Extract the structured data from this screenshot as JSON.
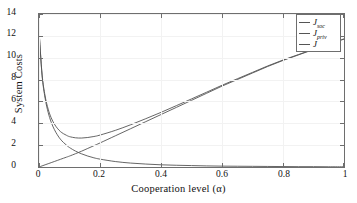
{
  "chart_data": {
    "type": "line",
    "title": "",
    "xlabel": "Cooperation level (α)",
    "ylabel": "System Costs",
    "xlim": [
      0,
      1
    ],
    "ylim": [
      0,
      14
    ],
    "xticks": [
      "0",
      "0.2",
      "0.4",
      "0.6",
      "0.8",
      "1"
    ],
    "xtick_values": [
      0,
      0.2,
      0.4,
      0.6,
      0.8,
      1
    ],
    "yticks": [
      "0",
      "2",
      "4",
      "6",
      "8",
      "10",
      "12",
      "14"
    ],
    "ytick_values": [
      0,
      2,
      4,
      6,
      8,
      10,
      12,
      14
    ],
    "grid": true,
    "legend_position": "top-right",
    "legend": [
      {
        "label_base": "J",
        "label_sub": "soc",
        "color": "#555555"
      },
      {
        "label_base": "J",
        "label_sub": "priv",
        "color": "#555555"
      },
      {
        "label_base": "J",
        "label_sub": "",
        "color": "#555555"
      }
    ],
    "x": [
      0,
      0.01,
      0.02,
      0.03,
      0.04,
      0.05,
      0.06,
      0.07,
      0.08,
      0.09,
      0.1,
      0.12,
      0.14,
      0.16,
      0.18,
      0.2,
      0.25,
      0.3,
      0.35,
      0.4,
      0.45,
      0.5,
      0.55,
      0.6,
      0.65,
      0.7,
      0.75,
      0.8,
      0.85,
      0.9,
      0.95,
      1
    ],
    "series": [
      {
        "name": "J_soc",
        "label": "J_{soc}",
        "color": "#555555",
        "values": [
          0,
          0.1,
          0.2,
          0.3,
          0.4,
          0.5,
          0.6,
          0.7,
          0.8,
          0.9,
          1.0,
          1.22,
          1.45,
          1.7,
          1.95,
          2.2,
          2.85,
          3.5,
          4.15,
          4.8,
          5.45,
          6.1,
          6.75,
          7.4,
          8.0,
          8.6,
          9.2,
          9.75,
          10.25,
          10.75,
          11.25,
          11.7
        ]
      },
      {
        "name": "J_priv",
        "label": "J_{priv}",
        "color": "#555555",
        "values": [
          12.5,
          8.4,
          6.3,
          5.0,
          4.1,
          3.45,
          2.95,
          2.55,
          2.25,
          2.0,
          1.78,
          1.45,
          1.2,
          1.0,
          0.84,
          0.72,
          0.5,
          0.36,
          0.27,
          0.2,
          0.16,
          0.13,
          0.1,
          0.08,
          0.07,
          0.06,
          0.05,
          0.04,
          0.03,
          0.03,
          0.02,
          0.02
        ]
      },
      {
        "name": "J",
        "label": "J",
        "color": "#555555",
        "values": [
          12.5,
          8.5,
          6.5,
          5.3,
          4.5,
          3.95,
          3.55,
          3.25,
          3.05,
          2.9,
          2.78,
          2.67,
          2.65,
          2.7,
          2.79,
          2.92,
          3.35,
          3.86,
          4.42,
          5.0,
          5.61,
          6.23,
          6.85,
          7.48,
          8.07,
          8.66,
          9.25,
          9.79,
          10.28,
          10.78,
          11.27,
          11.72
        ]
      }
    ],
    "annotations": {
      "min_of_total": {
        "x": 0.14,
        "y": 2.65
      },
      "crossover_soc_priv": {
        "x": 0.135,
        "y": 1.25
      },
      "endpoint_right": {
        "x": 1,
        "y": 11.7
      }
    }
  }
}
